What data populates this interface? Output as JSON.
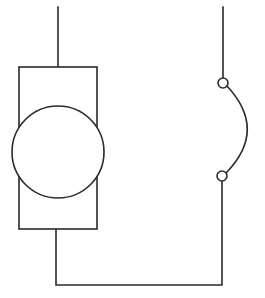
{
  "diagram": {
    "type": "circuit-schematic",
    "canvas": {
      "width": 265,
      "height": 298,
      "background": "#ffffff"
    },
    "stroke_color": "#2a2a2a",
    "components": [
      {
        "id": "motor",
        "kind": "dc-motor-rect-with-circle",
        "rect": {
          "x": 19,
          "y": 67,
          "w": 78,
          "h": 162
        },
        "circle": {
          "cx": 58,
          "cy": 152,
          "r": 46
        }
      },
      {
        "id": "switch",
        "kind": "arc-switch",
        "terminal_top": {
          "cx": 223,
          "cy": 83,
          "r": 5
        },
        "terminal_bottom": {
          "cx": 222,
          "cy": 176,
          "r": 5
        }
      }
    ],
    "wires": [
      {
        "id": "wire-left-top",
        "path": "M58 7 L58 67"
      },
      {
        "id": "wire-right-top",
        "path": "M223 7 L223 78"
      },
      {
        "id": "wire-bottom-loop",
        "path": "M56 229 L56 285 L222 285 L222 181"
      },
      {
        "id": "switch-arc",
        "path": "M227 86 Q268 130 226 173"
      }
    ]
  }
}
